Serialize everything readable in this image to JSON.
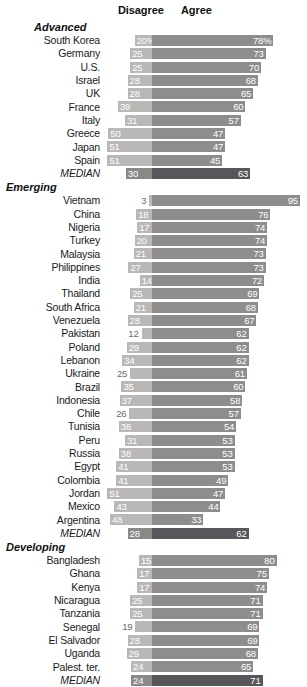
{
  "header": {
    "disagree_label": "Disagree",
    "agree_label": "Agree"
  },
  "colors": {
    "disagree_bar": "#b9b8b6",
    "agree_bar": "#8e8d8b",
    "median_disagree_bar": "#8a8987",
    "median_agree_bar": "#57565a",
    "value_text": "#ffffff",
    "outside_value_text": "#6a6a6a",
    "background": "#ffffff"
  },
  "chart_data": {
    "type": "bar",
    "subtype": "diverging-stacked-bar",
    "title": "",
    "xlabel": "",
    "ylabel": "",
    "legend": [
      "Disagree",
      "Agree"
    ],
    "legend_position": "top",
    "grid": false,
    "axis_range": [
      0,
      100
    ],
    "units": "percent",
    "groups": [
      {
        "name": "Advanced",
        "rows": [
          {
            "label": "South Korea",
            "disagree": 20,
            "agree": 78,
            "disagree_text": "20%",
            "agree_text": "78%",
            "median": false
          },
          {
            "label": "Germany",
            "disagree": 25,
            "agree": 73,
            "disagree_text": "25",
            "agree_text": "73",
            "median": false
          },
          {
            "label": "U.S.",
            "disagree": 25,
            "agree": 70,
            "disagree_text": "25",
            "agree_text": "70",
            "median": false
          },
          {
            "label": "Israel",
            "disagree": 28,
            "agree": 68,
            "disagree_text": "28",
            "agree_text": "68",
            "median": false
          },
          {
            "label": "UK",
            "disagree": 28,
            "agree": 65,
            "disagree_text": "28",
            "agree_text": "65",
            "median": false
          },
          {
            "label": "France",
            "disagree": 39,
            "agree": 60,
            "disagree_text": "39",
            "agree_text": "60",
            "median": false
          },
          {
            "label": "Italy",
            "disagree": 31,
            "agree": 57,
            "disagree_text": "31",
            "agree_text": "57",
            "median": false
          },
          {
            "label": "Greece",
            "disagree": 50,
            "agree": 47,
            "disagree_text": "50",
            "agree_text": "47",
            "median": false
          },
          {
            "label": "Japan",
            "disagree": 51,
            "agree": 47,
            "disagree_text": "51",
            "agree_text": "47",
            "median": false
          },
          {
            "label": "Spain",
            "disagree": 51,
            "agree": 45,
            "disagree_text": "51",
            "agree_text": "45",
            "median": false
          },
          {
            "label": "MEDIAN",
            "disagree": 30,
            "agree": 63,
            "disagree_text": "30",
            "agree_text": "63",
            "median": true
          }
        ]
      },
      {
        "name": "Emerging",
        "rows": [
          {
            "label": "Vietnam",
            "disagree": 3,
            "agree": 95,
            "disagree_text": "3",
            "agree_text": "95",
            "median": false,
            "disagree_outside": true
          },
          {
            "label": "China",
            "disagree": 18,
            "agree": 76,
            "disagree_text": "18",
            "agree_text": "76",
            "median": false
          },
          {
            "label": "Nigeria",
            "disagree": 17,
            "agree": 74,
            "disagree_text": "17",
            "agree_text": "74",
            "median": false
          },
          {
            "label": "Turkey",
            "disagree": 20,
            "agree": 74,
            "disagree_text": "20",
            "agree_text": "74",
            "median": false
          },
          {
            "label": "Malaysia",
            "disagree": 21,
            "agree": 73,
            "disagree_text": "21",
            "agree_text": "73",
            "median": false
          },
          {
            "label": "Philippines",
            "disagree": 27,
            "agree": 73,
            "disagree_text": "27",
            "agree_text": "73",
            "median": false
          },
          {
            "label": "India",
            "disagree": 14,
            "agree": 72,
            "disagree_text": "14",
            "agree_text": "72",
            "median": false
          },
          {
            "label": "Thailand",
            "disagree": 25,
            "agree": 69,
            "disagree_text": "25",
            "agree_text": "69",
            "median": false
          },
          {
            "label": "South Africa",
            "disagree": 21,
            "agree": 68,
            "disagree_text": "21",
            "agree_text": "68",
            "median": false
          },
          {
            "label": "Venezuela",
            "disagree": 28,
            "agree": 67,
            "disagree_text": "28",
            "agree_text": "67",
            "median": false
          },
          {
            "label": "Pakistan",
            "disagree": 12,
            "agree": 62,
            "disagree_text": "12",
            "agree_text": "62",
            "median": false,
            "disagree_outside": true
          },
          {
            "label": "Poland",
            "disagree": 29,
            "agree": 62,
            "disagree_text": "29",
            "agree_text": "62",
            "median": false
          },
          {
            "label": "Lebanon",
            "disagree": 34,
            "agree": 62,
            "disagree_text": "34",
            "agree_text": "62",
            "median": false
          },
          {
            "label": "Ukraine",
            "disagree": 25,
            "agree": 61,
            "disagree_text": "25",
            "agree_text": "61",
            "median": false,
            "disagree_outside": true
          },
          {
            "label": "Brazil",
            "disagree": 35,
            "agree": 60,
            "disagree_text": "35",
            "agree_text": "60",
            "median": false
          },
          {
            "label": "Indonesia",
            "disagree": 37,
            "agree": 58,
            "disagree_text": "37",
            "agree_text": "58",
            "median": false
          },
          {
            "label": "Chile",
            "disagree": 26,
            "agree": 57,
            "disagree_text": "26",
            "agree_text": "57",
            "median": false,
            "disagree_outside": true
          },
          {
            "label": "Tunisia",
            "disagree": 38,
            "agree": 54,
            "disagree_text": "38",
            "agree_text": "54",
            "median": false
          },
          {
            "label": "Peru",
            "disagree": 31,
            "agree": 53,
            "disagree_text": "31",
            "agree_text": "53",
            "median": false
          },
          {
            "label": "Russia",
            "disagree": 38,
            "agree": 53,
            "disagree_text": "38",
            "agree_text": "53",
            "median": false
          },
          {
            "label": "Egypt",
            "disagree": 41,
            "agree": 53,
            "disagree_text": "41",
            "agree_text": "53",
            "median": false
          },
          {
            "label": "Colombia",
            "disagree": 41,
            "agree": 49,
            "disagree_text": "41",
            "agree_text": "49",
            "median": false
          },
          {
            "label": "Jordan",
            "disagree": 51,
            "agree": 47,
            "disagree_text": "51",
            "agree_text": "47",
            "median": false
          },
          {
            "label": "Mexico",
            "disagree": 43,
            "agree": 44,
            "disagree_text": "43",
            "agree_text": "44",
            "median": false
          },
          {
            "label": "Argentina",
            "disagree": 48,
            "agree": 33,
            "disagree_text": "48",
            "agree_text": "33",
            "median": false
          },
          {
            "label": "MEDIAN",
            "disagree": 28,
            "agree": 62,
            "disagree_text": "28",
            "agree_text": "62",
            "median": true
          }
        ]
      },
      {
        "name": "Developing",
        "rows": [
          {
            "label": "Bangladesh",
            "disagree": 15,
            "agree": 80,
            "disagree_text": "15",
            "agree_text": "80",
            "median": false
          },
          {
            "label": "Ghana",
            "disagree": 17,
            "agree": 75,
            "disagree_text": "17",
            "agree_text": "75",
            "median": false
          },
          {
            "label": "Kenya",
            "disagree": 17,
            "agree": 74,
            "disagree_text": "17",
            "agree_text": "74",
            "median": false
          },
          {
            "label": "Nicaragua",
            "disagree": 25,
            "agree": 71,
            "disagree_text": "25",
            "agree_text": "71",
            "median": false
          },
          {
            "label": "Tanzania",
            "disagree": 25,
            "agree": 71,
            "disagree_text": "25",
            "agree_text": "71",
            "median": false
          },
          {
            "label": "Senegal",
            "disagree": 19,
            "agree": 69,
            "disagree_text": "19",
            "agree_text": "69",
            "median": false,
            "disagree_outside": true
          },
          {
            "label": "El Salvador",
            "disagree": 28,
            "agree": 69,
            "disagree_text": "28",
            "agree_text": "69",
            "median": false
          },
          {
            "label": "Uganda",
            "disagree": 29,
            "agree": 68,
            "disagree_text": "29",
            "agree_text": "68",
            "median": false
          },
          {
            "label": "Palest. ter.",
            "disagree": 24,
            "agree": 65,
            "disagree_text": "24",
            "agree_text": "65",
            "median": false
          },
          {
            "label": "MEDIAN",
            "disagree": 24,
            "agree": 71,
            "disagree_text": "24",
            "agree_text": "71",
            "median": true
          }
        ]
      }
    ]
  }
}
